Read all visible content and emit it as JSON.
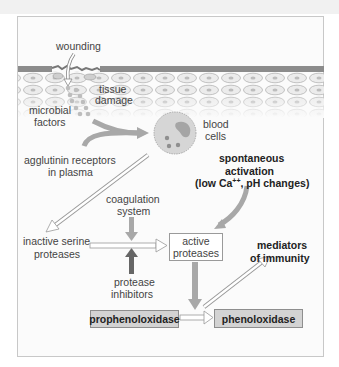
{
  "diagram": {
    "type": "pathway",
    "labels": {
      "wounding": "wounding",
      "tissue_damage_1": "tissue",
      "tissue_damage_2": "damage",
      "microbial_factors_1": "microbial",
      "microbial_factors_2": "factors",
      "blood_cells_1": "blood",
      "blood_cells_2": "cells",
      "agglutinin_1": "agglutinin receptors",
      "agglutinin_2": "in plasma",
      "spontaneous_1": "spontaneous",
      "spontaneous_2": "activation",
      "spontaneous_3_pre": "(low Ca",
      "spontaneous_3_sup": "++",
      "spontaneous_3_post": ", pH changes)",
      "coagulation_1": "coagulation",
      "coagulation_2": "system",
      "inactive_1": "inactive serine",
      "inactive_2": "proteases",
      "inhibitors_1": "protease",
      "inhibitors_2": "inhibitors",
      "mediators_1": "mediators",
      "mediators_2": "of immunity"
    },
    "boxes": {
      "active_proteases_1": "active",
      "active_proteases_2": "proteases",
      "prophenoloxidase": "prophenoloxidase",
      "phenoloxidase": "phenoloxidase"
    },
    "colors": {
      "frame_border": "#c8c8c8",
      "shaded_box": "#d3d3d3",
      "gray_arrow": "#a8a8a8",
      "dark_arrow": "#666666",
      "epidermis": "#8c8c8c"
    }
  }
}
